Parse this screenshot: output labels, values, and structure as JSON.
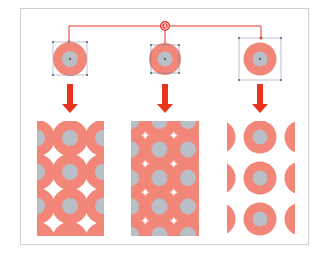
{
  "diagram": {
    "callout": {
      "label": "4",
      "color": "#e8332a"
    },
    "colors": {
      "ring": "#f28678",
      "core": "#b9bfc6",
      "center_dot": "#5d6a7a",
      "handle": "#6b7f9a",
      "bbox": "#8a9bb5",
      "arrow": "#e8331f",
      "frame": "#cfcfcf"
    },
    "tiles": [
      {
        "id": "tile-tight",
        "bounds": "bounding box slightly smaller than circle"
      },
      {
        "id": "tile-cropped",
        "bounds": "bounding box inside circle (cropped)"
      },
      {
        "id": "tile-padded",
        "bounds": "bounding box larger than circle (padded)"
      }
    ],
    "patterns": [
      {
        "id": "pattern-overlapping",
        "description": "circles overlap with white star gaps"
      },
      {
        "id": "pattern-filled",
        "description": "solid salmon fill with grey dots and white diamonds"
      },
      {
        "id": "pattern-spaced",
        "description": "separated circles with white space"
      }
    ]
  }
}
